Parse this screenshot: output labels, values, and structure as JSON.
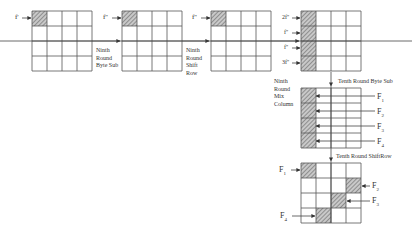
{
  "diagram": {
    "grid_size": 4,
    "colors": {
      "line": "#555555",
      "hatch": "#777777",
      "background": "#ffffff"
    },
    "grids": [
      {
        "id": "g1",
        "x": 32,
        "y": 11,
        "shaded": [
          [
            0,
            0
          ]
        ]
      },
      {
        "id": "g2",
        "x": 122,
        "y": 11,
        "shaded": [
          [
            0,
            0
          ]
        ]
      },
      {
        "id": "g3",
        "x": 211,
        "y": 11,
        "shaded": [
          [
            0,
            0
          ]
        ]
      },
      {
        "id": "g4",
        "x": 301,
        "y": 11,
        "shaded": [
          [
            0,
            0
          ],
          [
            1,
            0
          ],
          [
            2,
            0
          ],
          [
            3,
            0
          ]
        ]
      },
      {
        "id": "g5",
        "x": 301,
        "y": 88,
        "shaded": [
          [
            0,
            0
          ],
          [
            1,
            0
          ],
          [
            2,
            0
          ],
          [
            3,
            0
          ]
        ]
      },
      {
        "id": "g6",
        "x": 301,
        "y": 163,
        "shaded": [
          [
            0,
            0
          ],
          [
            1,
            3
          ],
          [
            2,
            2
          ],
          [
            3,
            1
          ]
        ]
      }
    ],
    "input_labels": {
      "g1": "f'",
      "g2": "f''",
      "g3": "f''",
      "g4": [
        "2f''",
        "f''",
        "f''",
        "3f''"
      ]
    },
    "step_labels": {
      "step1": [
        "Ninth",
        "Round",
        "Byte Sub"
      ],
      "step2": [
        "Ninth",
        "Round",
        "Shift",
        "Row"
      ],
      "step3": [
        "Ninth",
        "Round",
        "Mix",
        "Column"
      ],
      "step4": "Tenth Round Byte Sub",
      "step5": "Tenth Round ShiftRow"
    },
    "fault_labels_g5": [
      {
        "base": "F",
        "sub": "1"
      },
      {
        "base": "F",
        "sub": "2"
      },
      {
        "base": "F",
        "sub": "3"
      },
      {
        "base": "F",
        "sub": "4"
      }
    ],
    "fault_labels_g6": [
      {
        "base": "F",
        "sub": "1"
      },
      {
        "base": "F",
        "sub": "2"
      },
      {
        "base": "F",
        "sub": "3"
      },
      {
        "base": "F",
        "sub": "4"
      }
    ]
  }
}
